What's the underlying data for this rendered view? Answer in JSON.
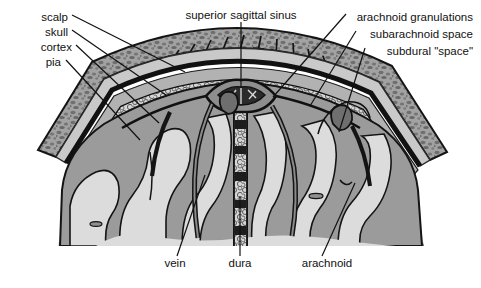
{
  "figure": {
    "type": "anatomical-diagram",
    "background_color": "#ffffff"
  },
  "labels": {
    "scalp": "scalp",
    "skull": "skull",
    "cortex": "cortex",
    "pia": "pia",
    "superior_sagittal_sinus": "superior sagittal sinus",
    "arachnoid_granulations": "arachnoid granulations",
    "subarachnoid_space": "subarachnoid space",
    "subdural_space": "subdural \"space\"",
    "vein": "vein",
    "dura": "dura",
    "arachnoid": "arachnoid"
  },
  "label_positions": {
    "scalp": {
      "x": 68,
      "y": 18,
      "align": "right"
    },
    "skull": {
      "x": 68,
      "y": 33,
      "align": "right"
    },
    "cortex": {
      "x": 72,
      "y": 48,
      "align": "right"
    },
    "pia": {
      "x": 61,
      "y": 63,
      "align": "right"
    },
    "superior_sagittal_sinus": {
      "x": 241,
      "y": 16,
      "align": "center"
    },
    "arachnoid_granulations": {
      "x": 473,
      "y": 18,
      "align": "right"
    },
    "subarachnoid_space": {
      "x": 473,
      "y": 35,
      "align": "right"
    },
    "subdural_space": {
      "x": 473,
      "y": 52,
      "align": "right"
    },
    "vein": {
      "x": 175,
      "y": 264,
      "align": "center"
    },
    "dura": {
      "x": 240,
      "y": 264,
      "align": "center"
    },
    "arachnoid": {
      "x": 327,
      "y": 264,
      "align": "center"
    }
  },
  "leader_lines": {
    "scalp": [
      [
        72,
        15
      ],
      [
        185,
        72
      ]
    ],
    "skull": [
      [
        72,
        30
      ],
      [
        166,
        95
      ]
    ],
    "cortex": [
      [
        76,
        45
      ],
      [
        159,
        123
      ]
    ],
    "pia": [
      [
        66,
        60
      ],
      [
        140,
        140
      ]
    ],
    "superior_sagittal_sinus": [
      [
        241,
        22
      ],
      [
        241,
        88
      ]
    ],
    "arachnoid_granulations": [
      [
        346,
        14
      ],
      [
        273,
        97
      ]
    ],
    "subarachnoid_space": [
      [
        356,
        31
      ],
      [
        310,
        106
      ]
    ],
    "subdural_space": [
      [
        365,
        48
      ],
      [
        339,
        132
      ]
    ],
    "vein": [
      [
        177,
        256
      ],
      [
        205,
        175
      ]
    ],
    "dura": [
      [
        240,
        256
      ],
      [
        240,
        196
      ]
    ],
    "arachnoid": [
      [
        322,
        256
      ],
      [
        355,
        183
      ]
    ]
  },
  "palette": {
    "ink": "#111111",
    "scalp_fill": "#8d8d8d",
    "skull_fill": "#9a9a9a",
    "skull_speckle": "#6d6d6d",
    "diploe_fill": "#c9c9c9",
    "dura_line": "#1a1a1a",
    "subdural_fill": "#b4b4b4",
    "subarachnoid_fill": "#d4d4d4",
    "cortex_gray": "#9b9b9b",
    "white_matter": "#d9d9d9",
    "sinus_lumen": "#2b2b2b",
    "granulation": "#7a7a7a",
    "vein_stroke": "#1a1a1a"
  },
  "structures": {
    "layers_outer_to_inner": [
      "scalp",
      "skull",
      "dura",
      "subdural \"space\"",
      "arachnoid",
      "subarachnoid space",
      "pia",
      "cortex"
    ],
    "midline": "falx cerebri with superior sagittal sinus at apex",
    "granulation_count": 2,
    "vein_count": 3
  }
}
